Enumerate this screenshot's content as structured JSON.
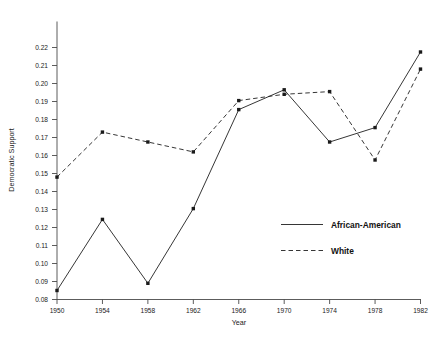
{
  "chart_data": {
    "type": "line",
    "title": "",
    "subtitle": "",
    "xlabel": "Year",
    "ylabel": "Democratic Support",
    "x": [
      1950,
      1954,
      1958,
      1962,
      1966,
      1970,
      1974,
      1978,
      1982
    ],
    "xtick_labels": [
      "1950",
      "1954",
      "1958",
      "1962",
      "1966",
      "1970",
      "1974",
      "1978",
      "1982"
    ],
    "ytick_labels": [
      "0.08",
      "0.09",
      "0.10",
      "0.11",
      "0.12",
      "0.13",
      "0.14",
      "0.15",
      "0.16",
      "0.17",
      "0.18",
      "0.19",
      "0.20",
      "0.21",
      "0.22"
    ],
    "ytick_values": [
      0.08,
      0.09,
      0.1,
      0.11,
      0.12,
      0.13,
      0.14,
      0.15,
      0.16,
      0.17,
      0.18,
      0.19,
      0.2,
      0.21,
      0.22
    ],
    "xlim": [
      1950,
      1982
    ],
    "ylim": [
      0.08,
      0.22
    ],
    "grid": false,
    "legend_position": "center-right-inside",
    "series": [
      {
        "name": "African-American",
        "style": "solid",
        "marker": "square",
        "color": "#2b2b2b",
        "values": [
          0.085,
          0.1245,
          0.089,
          0.1305,
          0.1855,
          0.1965,
          0.1675,
          0.1755,
          0.2175
        ]
      },
      {
        "name": "White",
        "style": "dashed",
        "marker": "square",
        "color": "#2b2b2b",
        "values": [
          0.148,
          0.173,
          0.1675,
          0.162,
          0.1905,
          0.194,
          0.1955,
          0.1575,
          0.208
        ]
      }
    ]
  },
  "legend": {
    "entries": [
      {
        "label": "African-American",
        "style": "solid"
      },
      {
        "label": "White",
        "style": "dashed"
      }
    ]
  }
}
